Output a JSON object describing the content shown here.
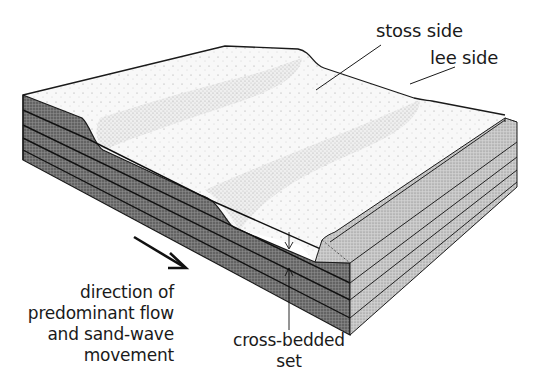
{
  "diagram": {
    "colors": {
      "background": "#ffffff",
      "top_surface": "#f7f7f7",
      "stoss_stipple": "#b8b8b8",
      "front_face": "#6f6f6f",
      "right_face": "#c4c4c4",
      "outline": "#1a1a1a"
    },
    "labels": {
      "stoss_side": "stoss side",
      "lee_side": "lee side",
      "flow_direction": [
        "direction of",
        "predominant flow",
        "and sand-wave",
        "movement"
      ],
      "cross_bedded_set": [
        "cross-bedded",
        "set"
      ]
    },
    "icons": {
      "flow_arrow": "arrow-down-right-icon",
      "bed_thickness_arrows": "double-arrow-vertical-icon"
    },
    "layers": {
      "count": 5
    }
  }
}
